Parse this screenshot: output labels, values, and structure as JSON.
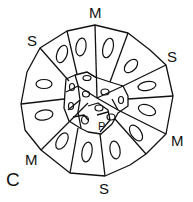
{
  "diagram": {
    "labels": {
      "top_m": "M",
      "top_left_s": "S",
      "top_right_s": "S",
      "right_m": "M",
      "bottom_s": "S",
      "left_m": "M",
      "corner_c": "C",
      "inner_p": "P"
    },
    "colors": {
      "stroke": "#111111",
      "background": "#ffffff"
    }
  }
}
